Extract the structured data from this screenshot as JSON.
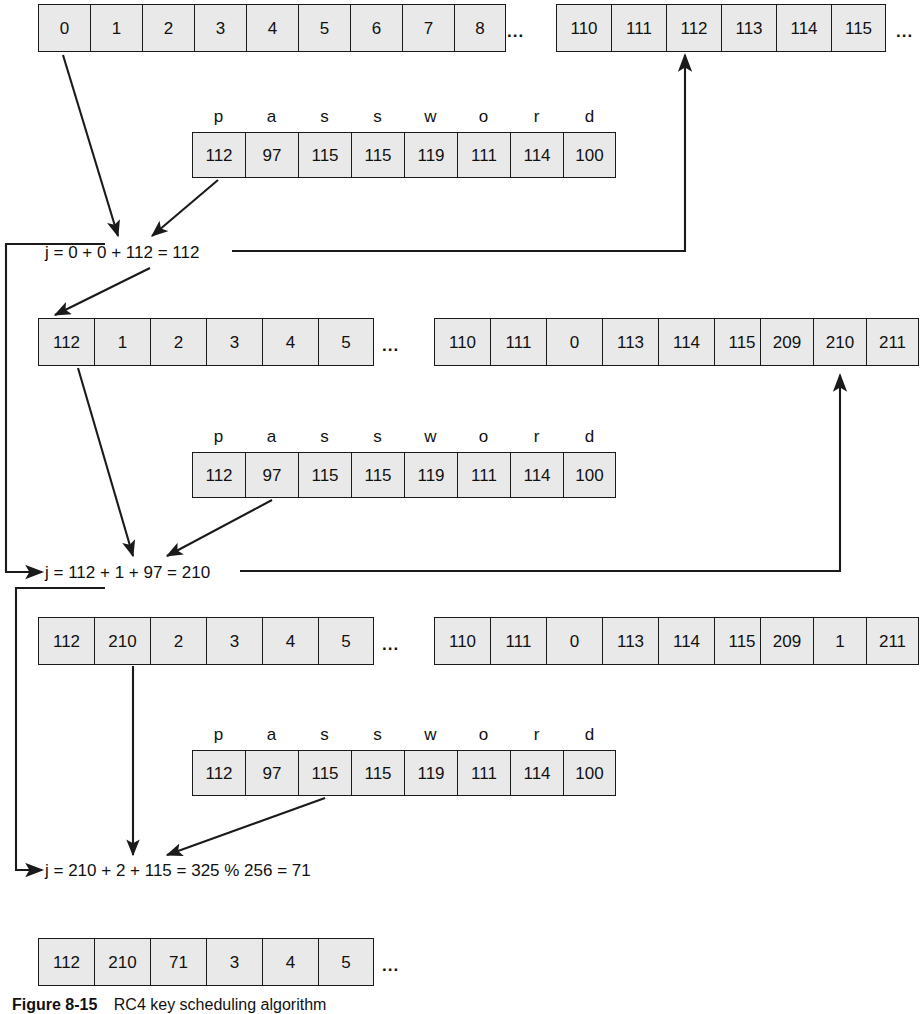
{
  "figure": {
    "caption_label": "Figure 8-15",
    "caption_text": "RC4 key scheduling algorithm",
    "ellipsis": "...",
    "password_letters": [
      "p",
      "a",
      "s",
      "s",
      "w",
      "o",
      "r",
      "d"
    ],
    "password_bytes": [
      "112",
      "97",
      "115",
      "115",
      "119",
      "111",
      "114",
      "100"
    ]
  },
  "rows": {
    "state_initial_left": [
      "0",
      "1",
      "2",
      "3",
      "4",
      "5",
      "6",
      "7",
      "8"
    ],
    "state_initial_right": [
      "110",
      "111",
      "112",
      "113",
      "114",
      "115"
    ],
    "step1_left": [
      "112",
      "1",
      "2",
      "3",
      "4",
      "5"
    ],
    "step1_mid": [
      "110",
      "111",
      "0",
      "113",
      "114",
      "115"
    ],
    "step1_right": [
      "209",
      "210",
      "211"
    ],
    "step2_left": [
      "112",
      "210",
      "2",
      "3",
      "4",
      "5"
    ],
    "step2_mid": [
      "110",
      "111",
      "0",
      "113",
      "114",
      "115"
    ],
    "step2_right": [
      "209",
      "1",
      "211"
    ],
    "final": [
      "112",
      "210",
      "71",
      "3",
      "4",
      "5"
    ]
  },
  "formulas": {
    "j1": "j = 0 + 0 + 112 = 112",
    "j2": "j = 112 + 1 + 97 = 210",
    "j3": "j = 210 + 2 + 115 = 325 % 256 = 71"
  },
  "colors": {
    "cell_fill": "#e9e9e9",
    "stroke": "#1a1a1a",
    "text": "#111111"
  }
}
